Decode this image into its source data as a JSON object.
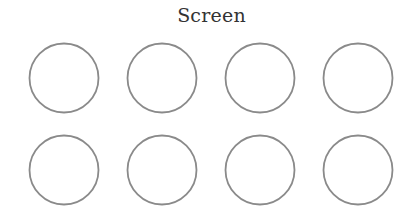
{
  "title": "Screen",
  "layout": {
    "rows": 2,
    "columns": 4
  },
  "seats": [
    {
      "row": 1,
      "col": 1
    },
    {
      "row": 1,
      "col": 2
    },
    {
      "row": 1,
      "col": 3
    },
    {
      "row": 1,
      "col": 4
    },
    {
      "row": 2,
      "col": 1
    },
    {
      "row": 2,
      "col": 2
    },
    {
      "row": 2,
      "col": 3
    },
    {
      "row": 2,
      "col": 4
    }
  ],
  "colors": {
    "seat_outline": "#8a8a8a",
    "title_text": "#333333"
  }
}
